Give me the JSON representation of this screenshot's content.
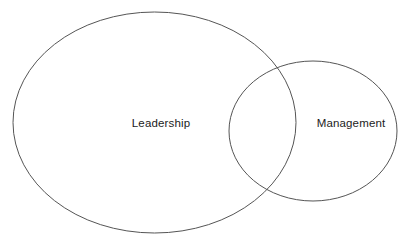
{
  "diagram": {
    "type": "venn",
    "title": "",
    "background_color": "#ffffff",
    "stroke_color": "#555555",
    "text_color": "#1c1c1c",
    "canvas": {
      "width": 417,
      "height": 248
    },
    "sets": [
      {
        "name": "leadership-set",
        "label": "Leadership",
        "shape": "ellipse",
        "cx": 154.5,
        "cy": 122.5,
        "rx": 141.5,
        "ry": 110.5,
        "label_x": 161,
        "label_y": 124,
        "fill": "none"
      },
      {
        "name": "management-set",
        "label": "Management",
        "shape": "ellipse",
        "cx": 313,
        "cy": 131,
        "rx": 84,
        "ry": 70,
        "label_x": 351,
        "label_y": 124,
        "fill": "none"
      }
    ],
    "intersection": {
      "label": "",
      "upper_crossing": {
        "x": 283,
        "y": 70
      },
      "lower_crossing": {
        "x": 271,
        "y": 196
      }
    }
  }
}
